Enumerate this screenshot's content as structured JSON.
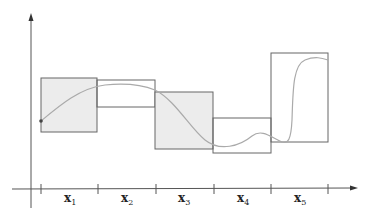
{
  "diagram": {
    "colors": {
      "axis": "#555555",
      "box_stroke": "#666666",
      "shaded_fill": "#ececec",
      "curve": "#aaaaaa",
      "dot": "#444444"
    },
    "axis_labels": [
      {
        "base": "x",
        "sub": "1"
      },
      {
        "base": "x",
        "sub": "2"
      },
      {
        "base": "x",
        "sub": "3"
      },
      {
        "base": "x",
        "sub": "4"
      },
      {
        "base": "x",
        "sub": "5"
      }
    ],
    "boxes": [
      {
        "interval": "x1",
        "shaded": true
      },
      {
        "interval": "x2",
        "shaded": false
      },
      {
        "interval": "x3",
        "shaded": true
      },
      {
        "interval": "x4",
        "shaded": false
      },
      {
        "interval": "x5",
        "shaded": false
      }
    ]
  }
}
